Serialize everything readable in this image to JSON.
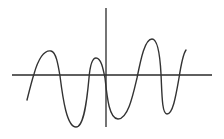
{
  "figure": {
    "type": "function-graph",
    "colors": {
      "background": "#ffffff",
      "axis": "#2a2a2a",
      "curve": "#333333"
    }
  },
  "axes": {
    "x_axis": {
      "x1": 12,
      "y1": 75,
      "x2": 212,
      "y2": 75
    },
    "y_axis": {
      "x1": 106,
      "y1": 8,
      "x2": 106,
      "y2": 127
    }
  },
  "curve": {
    "path": "M27,100 C30,88 32,80 34,74 C38,60 44,50 51,51 C56,52 58,64 60,76 C63,100 67,127 76,127 C84,127 87,100 89,78 C90,66 92,58 96,58 C101,58 103,68 105,78 C107,96 109,119 118,119 C128,119 133,95 137,78 C141,58 145,39 152,39 C158,39 160,55 161,74 C162,95 162,114 167,114 C173,114 176,95 179,78 C181,65 183,54 186,50"
  }
}
